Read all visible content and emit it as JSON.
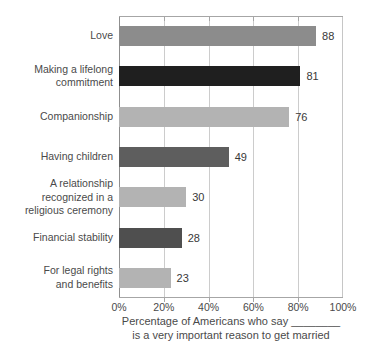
{
  "chart_data": {
    "type": "bar",
    "orientation": "horizontal",
    "categories": [
      "Love",
      "Making a lifelong\ncommitment",
      "Companionship",
      "Having children",
      "A relationship\nrecognized in a\nreligious ceremony",
      "Financial stability",
      "For legal rights\nand benefits"
    ],
    "values": [
      88,
      81,
      76,
      49,
      30,
      28,
      23
    ],
    "bar_colors": [
      "#8c8c8c",
      "#1f1f1f",
      "#b3b3b3",
      "#5e5e5e",
      "#b3b3b3",
      "#4f4f4f",
      "#b3b3b3"
    ],
    "x_ticks": [
      "0%",
      "20%",
      "40%",
      "60%",
      "80%",
      "100%"
    ],
    "xlim": [
      0,
      100
    ],
    "grid": "vertical-only",
    "value_labels_shown": true,
    "xlabel_line1": "Percentage of Americans who say ________",
    "xlabel_line2": "is a very important reason to get married"
  },
  "colors": {
    "background": "#ffffff",
    "axis_line": "#8f8f8f",
    "gridline": "#cccccc",
    "frame": "#a6a6a6",
    "category_text": "#4a4a4a",
    "value_text": "#383838"
  }
}
